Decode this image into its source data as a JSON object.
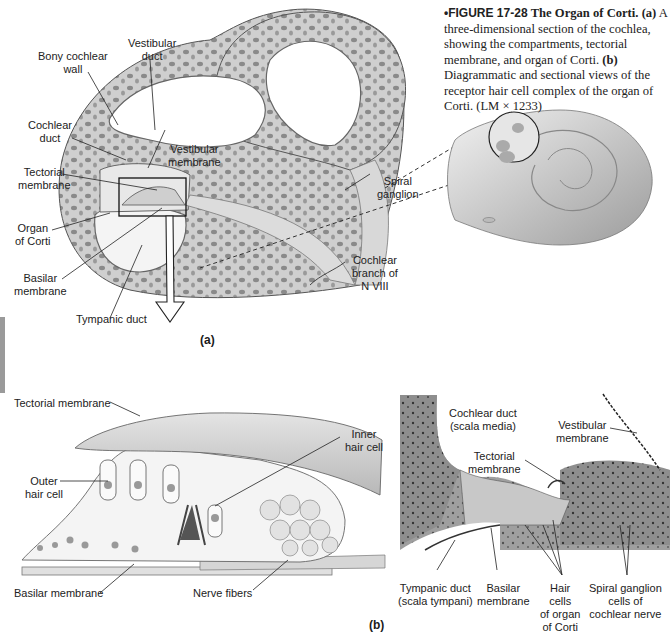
{
  "caption": {
    "figure_number": "•FIGURE 17-28",
    "title": "The Organ of Corti.",
    "part_a_marker": "(a)",
    "part_a_text": "A three-dimensional section of the cochlea, showing the compartments, tectorial membrane, and organ of Corti.",
    "part_b_marker": "(b)",
    "part_b_text": "Diagrammatic and sectional views of the receptor hair cell complex of the organ of Corti. (LM × 1233)"
  },
  "panel_a": {
    "label": "(a)",
    "labels": {
      "bony_wall_1": "Bony cochlear",
      "bony_wall_2": "wall",
      "vestibular_duct_1": "Vestibular",
      "vestibular_duct_2": "duct",
      "cochlear_duct_1": "Cochlear",
      "cochlear_duct_2": "duct",
      "vestibular_membrane_1": "Vestibular",
      "vestibular_membrane_2": "membrane",
      "tectorial_membrane_1": "Tectorial",
      "tectorial_membrane_2": "membrane",
      "organ_corti_1": "Organ",
      "organ_corti_2": "of Corti",
      "basilar_membrane_1": "Basilar",
      "basilar_membrane_2": "membrane",
      "tympanic_duct": "Tympanic duct",
      "spiral_ganglion_1": "Spiral",
      "spiral_ganglion_2": "ganglion",
      "cochlear_branch_1": "Cochlear",
      "cochlear_branch_2": "branch of",
      "cochlear_branch_3": "N VIII"
    }
  },
  "panel_b": {
    "label": "(b)",
    "diagram_labels": {
      "tectorial_membrane": "Tectorial membrane",
      "outer_hair_cell_1": "Outer",
      "outer_hair_cell_2": "hair cell",
      "inner_hair_cell_1": "Inner",
      "inner_hair_cell_2": "hair cell",
      "basilar_membrane": "Basilar membrane",
      "nerve_fibers": "Nerve fibers"
    },
    "micrograph_labels": {
      "cochlear_duct_1": "Cochlear duct",
      "cochlear_duct_2": "(scala media)",
      "vestibular_membrane_1": "Vestibular",
      "vestibular_membrane_2": "membrane",
      "tectorial_membrane_1": "Tectorial",
      "tectorial_membrane_2": "membrane",
      "tympanic_duct_1": "Tympanic duct",
      "tympanic_duct_2": "(scala tympani)",
      "basilar_membrane_1": "Basilar",
      "basilar_membrane_2": "membrane",
      "hair_cells_1": "Hair",
      "hair_cells_2": "cells",
      "hair_cells_3": "of organ",
      "hair_cells_4": "of Corti",
      "spiral_ganglion_1": "Spiral ganglion",
      "spiral_ganglion_2": "cells of",
      "spiral_ganglion_3": "cochlear nerve"
    }
  }
}
